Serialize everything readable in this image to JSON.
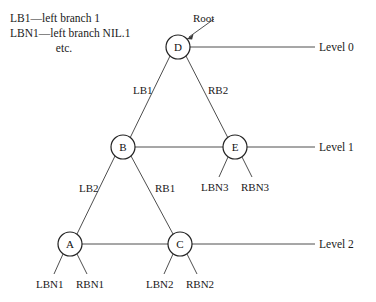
{
  "figure": {
    "type": "binary-tree-diagram",
    "background_color": "#ffffff",
    "stroke_color": "#3a3a3a",
    "text_color": "#1a1a1a"
  },
  "legend": {
    "line1": "LB1—left branch 1",
    "line2": "LBN1—left branch NIL.1",
    "line3": "etc."
  },
  "annotations": {
    "root_label": "Root"
  },
  "nodes": {
    "d": {
      "label": "D",
      "cx": 178,
      "cy": 47,
      "r": 12
    },
    "b": {
      "label": "B",
      "cx": 123,
      "cy": 147,
      "r": 12
    },
    "e": {
      "label": "E",
      "cx": 235,
      "cy": 147,
      "r": 12
    },
    "a": {
      "label": "A",
      "cx": 70,
      "cy": 244,
      "r": 12
    },
    "c": {
      "label": "C",
      "cx": 180,
      "cy": 244,
      "r": 12
    }
  },
  "edge_labels": {
    "d_to_b": "LB1",
    "d_to_e": "RB2",
    "b_to_a": "LB2",
    "b_to_c": "RB1"
  },
  "leaf_labels": {
    "a_left": "LBN1",
    "a_right": "RBN1",
    "c_left": "LBN2",
    "c_right": "RBN2",
    "e_left": "LBN3",
    "e_right": "RBN3"
  },
  "levels": {
    "level0": "Level 0",
    "level1": "Level 1",
    "level2": "Level 2"
  }
}
